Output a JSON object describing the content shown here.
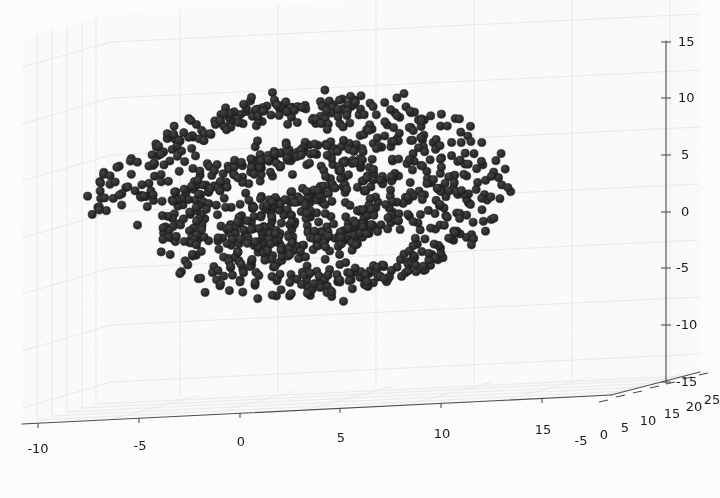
{
  "figure": {
    "kind": "3d-scatter-plot",
    "width": 720,
    "height": 498,
    "background_color": "#fefefe",
    "title": "",
    "marker_color": "#2b2b2b",
    "marker_edge_color": "#1a1a1a",
    "marker_radius_px": 4.1,
    "grid_color": "#e8e8ea",
    "axis_line_color": "#4a4a4a",
    "pane_color": "#fbfbfc"
  },
  "axes": {
    "x": {
      "label": "",
      "ticks": [
        "-10",
        "-5",
        "0",
        "5",
        "10",
        "15"
      ],
      "tick_values": [
        -10,
        -5,
        0,
        5,
        10,
        15
      ],
      "range": [
        -12.5,
        17.5
      ]
    },
    "y": {
      "label": "",
      "ticks": [
        "-5",
        "0",
        "5",
        "10",
        "15",
        "20",
        "25"
      ],
      "tick_values": [
        -5,
        0,
        5,
        10,
        15,
        20,
        25
      ],
      "range": [
        -7,
        27
      ]
    },
    "z": {
      "label": "",
      "ticks": [
        "15",
        "10",
        "5",
        "0",
        "-5",
        "-10",
        "-15"
      ],
      "tick_values": [
        15,
        10,
        5,
        0,
        -5,
        -10,
        -15
      ],
      "range": [
        -17,
        17
      ]
    }
  },
  "chart_data": {
    "type": "scatter",
    "title": "",
    "xlabel": "",
    "ylabel": "",
    "zlabel": "",
    "grid": true,
    "legend": null,
    "projection": "3d",
    "n_points": 1100,
    "xlim": [
      -12.5,
      17.5
    ],
    "ylim": [
      -7,
      27
    ],
    "zlim": [
      -17,
      17
    ],
    "xticks": [
      -10,
      -5,
      0,
      5,
      10,
      15
    ],
    "yticks": [
      -5,
      0,
      5,
      10,
      15,
      20,
      25
    ],
    "zticks": [
      -15,
      -10,
      -5,
      0,
      5,
      10,
      15
    ],
    "generator": {
      "family": "swiss_roll",
      "turns": 2.25,
      "theta_start_rad": 1.6,
      "theta_end_rad": 15.7,
      "radius_of_theta": "r = 0.62 * theta",
      "x_of_theta": "x = r * cos(theta)",
      "z_of_theta": "z = r * sin(theta)",
      "y_uniform_range": [
        -5,
        25
      ],
      "radial_jitter_sigma": 0.55,
      "y_jitter_sigma": 0.8
    },
    "series": [
      {
        "name": "spiral manifold samples",
        "color": "#2b2b2b",
        "marker": "circle",
        "size_px": 8.2,
        "n": 1100
      }
    ]
  }
}
